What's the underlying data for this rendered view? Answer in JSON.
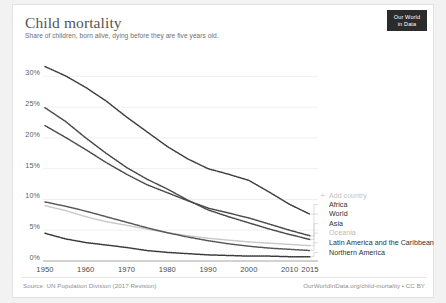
{
  "header": {
    "title": "Child mortality",
    "subtitle": "Share of children, born alive, dying before they are five years old.",
    "logo_line1": "Our World",
    "logo_line2": "in Data"
  },
  "legend": {
    "add_country_label": "Add country",
    "plus_icon": "+",
    "items": [
      {
        "label": "Africa",
        "color": "#3f3f3f",
        "muted": false
      },
      {
        "label": "World",
        "color": "#4a4a4a",
        "muted": false
      },
      {
        "label": "Asia",
        "color": "#4a4a4a",
        "muted": false
      },
      {
        "label": "Oceania",
        "color": "#c9c9c9",
        "muted": true
      },
      {
        "label": "Latin America and the Caribbean",
        "color": "#565656",
        "muted": false
      },
      {
        "label": "Northern America",
        "color": "#3a3a3a",
        "muted": false
      }
    ]
  },
  "footer": {
    "source": "Source: UN Population Division (2017 Revision)",
    "license": "OurWorldInData.org/child-mortality • CC BY"
  },
  "chart_data": {
    "type": "line",
    "title": "Child mortality",
    "subtitle": "Share of children, born alive, dying before they are five years old.",
    "xlabel": "",
    "ylabel": "",
    "xlim": [
      1950,
      2015
    ],
    "ylim": [
      0,
      32.5
    ],
    "grid": true,
    "legend_position": "right-inside",
    "ytick_labels": [
      "30%",
      "25%",
      "20%",
      "15%",
      "10%",
      "5%",
      "0%"
    ],
    "ytick_values": [
      30,
      25,
      20,
      15,
      10,
      5,
      0
    ],
    "xtick_labels": [
      "1950",
      "1960",
      "1970",
      "1980",
      "1990",
      "2000",
      "2010",
      "2015"
    ],
    "xtick_values": [
      1950,
      1960,
      1970,
      1980,
      1990,
      2000,
      2010,
      2015
    ],
    "x": [
      1950,
      1955,
      1960,
      1965,
      1970,
      1975,
      1980,
      1985,
      1990,
      1995,
      2000,
      2005,
      2010,
      2015
    ],
    "series": [
      {
        "name": "Africa",
        "color": "#3f3f3f",
        "values": [
          31.6,
          30.1,
          28.2,
          26.0,
          23.4,
          21.0,
          18.6,
          16.6,
          15.0,
          14.1,
          13.1,
          11.2,
          9.2,
          7.6
        ]
      },
      {
        "name": "World",
        "color": "#4a4a4a",
        "values": [
          22.0,
          20.1,
          18.1,
          16.0,
          14.1,
          12.4,
          11.1,
          9.8,
          8.6,
          7.8,
          7.0,
          6.0,
          5.0,
          4.1
        ]
      },
      {
        "name": "Asia",
        "color": "#4a4a4a",
        "values": [
          24.9,
          22.7,
          20.0,
          17.5,
          15.2,
          13.3,
          11.7,
          9.9,
          8.3,
          7.2,
          6.2,
          5.2,
          4.3,
          3.5
        ]
      },
      {
        "name": "Oceania",
        "color": "#c9c9c9",
        "values": [
          9.0,
          8.2,
          7.2,
          6.4,
          5.8,
          5.2,
          4.6,
          4.1,
          3.7,
          3.4,
          3.1,
          2.9,
          2.7,
          2.5
        ]
      },
      {
        "name": "Latin America and the Caribbean",
        "color": "#565656",
        "values": [
          9.6,
          8.9,
          8.1,
          7.2,
          6.3,
          5.4,
          4.6,
          3.9,
          3.3,
          2.8,
          2.4,
          2.1,
          1.9,
          1.7
        ]
      },
      {
        "name": "Northern America",
        "color": "#3a3a3a",
        "values": [
          4.5,
          3.6,
          3.0,
          2.6,
          2.2,
          1.7,
          1.4,
          1.2,
          1.0,
          0.9,
          0.8,
          0.8,
          0.7,
          0.7
        ]
      }
    ]
  }
}
